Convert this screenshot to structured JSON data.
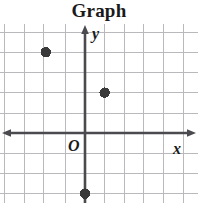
{
  "title": "Graph",
  "axes": {
    "x_label": "x",
    "y_label": "y",
    "origin_label": "O"
  },
  "colors": {
    "grid": "#b9b9bd",
    "axis": "#4a4a4f",
    "point": "#3a3a3a",
    "title": "#1a1a1a",
    "background": "#ffffff"
  },
  "chart_data": {
    "type": "scatter",
    "title": "Graph",
    "xlabel": "x",
    "ylabel": "y",
    "xlim": [
      -5,
      6
    ],
    "ylim": [
      -4,
      6
    ],
    "grid": true,
    "legend": false,
    "x_ticks": [],
    "y_ticks": [],
    "points": [
      {
        "x": -2,
        "y": 4
      },
      {
        "x": 1,
        "y": 2
      },
      {
        "x": 0,
        "y": -3
      }
    ],
    "series": [
      {
        "name": "plotted points",
        "x": [
          -2,
          1,
          0
        ],
        "y": [
          4,
          2,
          -3
        ]
      }
    ],
    "annotations": [
      {
        "text": "O",
        "x": 0,
        "y": 0,
        "role": "origin-label"
      }
    ]
  },
  "geometry": {
    "origin_px": {
      "x": 85,
      "y": 109
    },
    "cell_px": {
      "w": 19.6,
      "h": 20.2
    },
    "vertical_gridlines_px": [
      4.4,
      24.0,
      43.6,
      65.0,
      85.0,
      104.6,
      124.2,
      143.8,
      163.4,
      183.0
    ],
    "horizontal_gridlines_px": [
      8,
      28,
      48,
      68,
      89,
      109,
      129,
      149,
      169
    ],
    "point_radius_px": 5.2,
    "points_px": [
      {
        "x": 43.6,
        "y": 24
      },
      {
        "x": 104.6,
        "y": 66
      },
      {
        "x": 85,
        "y": 172
      }
    ]
  }
}
